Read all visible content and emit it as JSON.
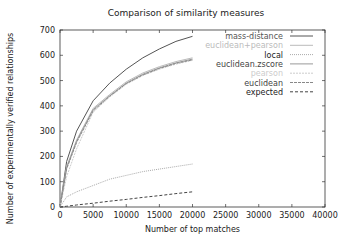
{
  "chart_data": {
    "type": "line",
    "title": "Comparison of similarity measures",
    "xlabel": "Number of top matches",
    "ylabel": "Number of experimentally verified relationships",
    "xlim": [
      0,
      40000
    ],
    "ylim": [
      0,
      700
    ],
    "xticks": [
      0,
      5000,
      10000,
      15000,
      20000,
      25000,
      30000,
      35000,
      40000
    ],
    "yticks": [
      0,
      100,
      200,
      300,
      400,
      500,
      600,
      700
    ],
    "grid": false,
    "legend_position": "upper right",
    "x": [
      0,
      1000,
      2500,
      5000,
      7500,
      10000,
      12500,
      15000,
      17500,
      20000
    ],
    "series": [
      {
        "name": "mass-distance",
        "color": "#555555",
        "dash": "",
        "values": [
          0,
          180,
          300,
          420,
          490,
          545,
          590,
          625,
          655,
          675
        ]
      },
      {
        "name": "euclidean+pearson",
        "color": "#bbbbbb",
        "dash": "",
        "values": [
          0,
          160,
          265,
          390,
          445,
          495,
          530,
          555,
          575,
          590
        ]
      },
      {
        "name": "local",
        "color": "#aaaaaa",
        "dash": "1,1",
        "values": [
          0,
          40,
          60,
          85,
          110,
          125,
          140,
          150,
          160,
          170
        ]
      },
      {
        "name": "euclidean.zscore",
        "color": "#999999",
        "dash": "",
        "values": [
          0,
          155,
          260,
          385,
          440,
          490,
          525,
          550,
          570,
          585
        ]
      },
      {
        "name": "pearson",
        "color": "#cccccc",
        "dash": "2,1",
        "values": [
          0,
          120,
          230,
          375,
          435,
          485,
          520,
          545,
          565,
          580
        ]
      },
      {
        "name": "euclidean",
        "color": "#888888",
        "dash": "3,1",
        "values": [
          0,
          150,
          255,
          380,
          438,
          488,
          522,
          548,
          568,
          582
        ]
      },
      {
        "name": "expected",
        "color": "#444444",
        "dash": "3,2",
        "values": [
          0,
          3,
          8,
          15,
          23,
          30,
          38,
          45,
          53,
          60
        ]
      }
    ]
  },
  "legend": {
    "items": [
      {
        "label": "mass-distance",
        "color": "#555555"
      },
      {
        "label": "euclidean+pearson",
        "color": "#bbbbbb"
      },
      {
        "label": "local",
        "color": "#222222"
      },
      {
        "label": "euclidean.zscore",
        "color": "#444444"
      },
      {
        "label": "pearson",
        "color": "#cccccc"
      },
      {
        "label": "euclidean",
        "color": "#444444"
      },
      {
        "label": "expected",
        "color": "#222222"
      }
    ]
  }
}
